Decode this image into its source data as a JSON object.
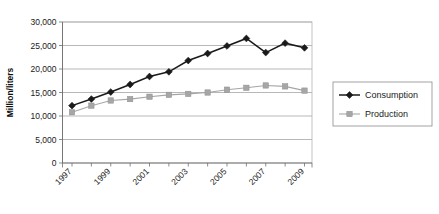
{
  "chart_data": {
    "type": "line",
    "title": "",
    "xlabel": "",
    "ylabel": "Million/liters",
    "ylim": [
      0,
      30000
    ],
    "ystep": 5000,
    "grid": true,
    "legend_position": "right",
    "x": [
      1997,
      1998,
      1999,
      2000,
      2001,
      2002,
      2003,
      2004,
      2005,
      2006,
      2007,
      2008,
      2009
    ],
    "xtick_labels": [
      "1997",
      "1999",
      "2001",
      "2003",
      "2005",
      "2007",
      "2009"
    ],
    "xtick_values": [
      1997,
      1999,
      2001,
      2003,
      2005,
      2007,
      2009
    ],
    "ytick_labels": [
      "0",
      "5,000",
      "10,000",
      "15,000",
      "20,000",
      "25,000",
      "30,000"
    ],
    "ytick_values": [
      0,
      5000,
      10000,
      15000,
      20000,
      25000,
      30000
    ],
    "series": [
      {
        "name": "Consumption",
        "color": "#1a1a1a",
        "marker": "diamond",
        "values": [
          12200,
          13600,
          15100,
          16700,
          18400,
          19400,
          21800,
          23300,
          24900,
          26500,
          23500,
          25500,
          24500
        ]
      },
      {
        "name": "Production",
        "color": "#a6a6a6",
        "marker": "square",
        "values": [
          10800,
          12200,
          13300,
          13600,
          14100,
          14500,
          14700,
          15000,
          15600,
          16000,
          16500,
          16300,
          15400
        ]
      }
    ]
  },
  "legend": {
    "items": [
      {
        "label": "Consumption"
      },
      {
        "label": "Production"
      }
    ]
  },
  "axes": {
    "y_title": "Million/liters"
  }
}
